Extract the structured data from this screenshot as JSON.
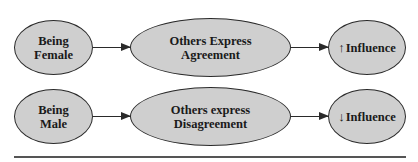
{
  "diagram": {
    "type": "flow",
    "rows": [
      {
        "nodes": [
          {
            "id": "being-female",
            "label": "Being\nFemale"
          },
          {
            "id": "others-express-agreement",
            "label": "Others Express\nAgreement"
          },
          {
            "id": "influence-up",
            "arrow": "↑",
            "label": "Influence"
          }
        ],
        "edges": [
          {
            "from": "being-female",
            "to": "others-express-agreement"
          },
          {
            "from": "others-express-agreement",
            "to": "influence-up"
          }
        ]
      },
      {
        "nodes": [
          {
            "id": "being-male",
            "label": "Being\nMale"
          },
          {
            "id": "others-express-disagreement",
            "label": "Others express\nDisagreement"
          },
          {
            "id": "influence-down",
            "arrow": "↓",
            "label": "Influence"
          }
        ],
        "edges": [
          {
            "from": "being-male",
            "to": "others-express-disagreement"
          },
          {
            "from": "others-express-disagreement",
            "to": "influence-down"
          }
        ]
      }
    ],
    "colors": {
      "node_fill": "#cfcfcf",
      "node_stroke": "#2a2a2a",
      "text": "#1a1a1a",
      "rule": "#555555"
    }
  }
}
